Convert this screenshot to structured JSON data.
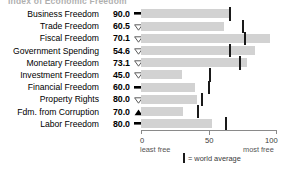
{
  "title": "Index of Economic Freedom",
  "chart_data": {
    "type": "bar",
    "orientation": "horizontal",
    "title": "Index of Economic Freedom",
    "xlabel": "",
    "ylabel": "",
    "xlim": [
      0,
      100
    ],
    "xticks": [
      0,
      50,
      100
    ],
    "xtick_labels": [
      "0",
      "50",
      "100"
    ],
    "grid": false,
    "axis_end_labels": {
      "left": "least free",
      "right": "most free"
    },
    "legend": {
      "label": "= world average",
      "marker": "vertical-tick",
      "position": "bottom-center"
    },
    "bar_color": "#d2d2d2",
    "average_marker_color": "#1a1a1a",
    "categories": [
      "Business Freedom",
      "Trade Freedom",
      "Fiscal Freedom",
      "Government Spending",
      "Monetary Freedom",
      "Investment Freedom",
      "Financial Freedom",
      "Property Rights",
      "Fdm. from Corruption",
      "Labor Freedom"
    ],
    "values": [
      90.0,
      60.5,
      70.1,
      54.6,
      73.1,
      45.0,
      60.0,
      80.0,
      70.0,
      80.0
    ],
    "series": [
      {
        "name": "Score",
        "values": [
          90.0,
          60.5,
          70.1,
          54.6,
          73.1,
          45.0,
          60.0,
          80.0,
          70.0,
          80.0
        ]
      },
      {
        "name": "World average",
        "values": [
          65,
          74,
          76,
          65,
          72,
          50,
          49,
          44,
          41,
          62
        ]
      }
    ],
    "trends": [
      "flat",
      "down",
      "down",
      "down",
      "down",
      "down",
      "flat",
      "down",
      "up",
      "flat"
    ]
  },
  "rows": [
    {
      "label": "Business Freedom",
      "value": "90.0",
      "trend": "flat",
      "bar": 65,
      "avg": 65
    },
    {
      "label": "Trade Freedom",
      "value": "60.5",
      "trend": "down",
      "bar": 61,
      "avg": 74
    },
    {
      "label": "Fiscal Freedom",
      "value": "70.1",
      "trend": "down",
      "bar": 95,
      "avg": 76
    },
    {
      "label": "Government Spending",
      "value": "54.6",
      "trend": "down",
      "bar": 84,
      "avg": 65
    },
    {
      "label": "Monetary Freedom",
      "value": "73.1",
      "trend": "down",
      "bar": 78,
      "avg": 72
    },
    {
      "label": "Investment Freedom",
      "value": "45.0",
      "trend": "down",
      "bar": 30,
      "avg": 50
    },
    {
      "label": "Financial Freedom",
      "value": "60.0",
      "trend": "flat",
      "bar": 40,
      "avg": 49
    },
    {
      "label": "Property Rights",
      "value": "80.0",
      "trend": "down",
      "bar": 41,
      "avg": 44
    },
    {
      "label": "Fdm. from Corruption",
      "value": "70.0",
      "trend": "up",
      "bar": 31,
      "avg": 41
    },
    {
      "label": "Labor Freedom",
      "value": "80.0",
      "trend": "flat",
      "bar": 52,
      "avg": 62
    }
  ],
  "axis": {
    "tick0": "0",
    "tick50": "50",
    "tick100": "100",
    "least_free": "least free",
    "most_free": "most free"
  },
  "legend": {
    "text": "= world average"
  }
}
